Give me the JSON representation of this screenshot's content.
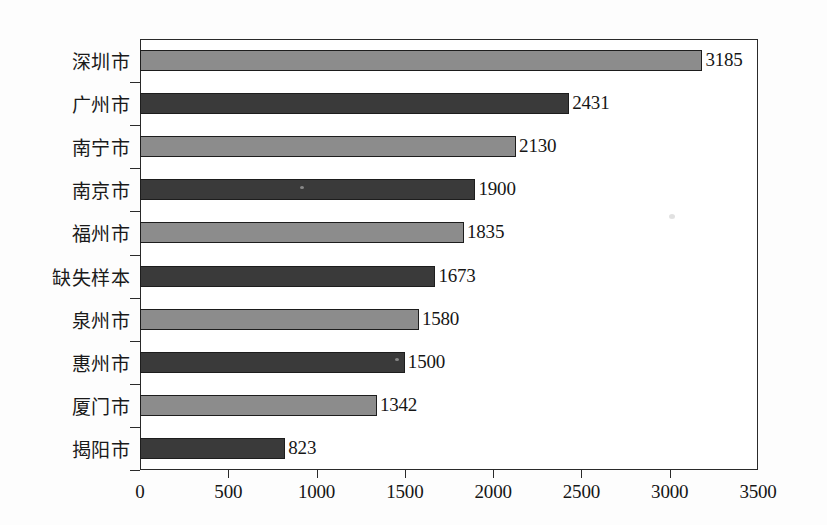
{
  "chart_data": {
    "type": "bar",
    "orientation": "horizontal",
    "title": "",
    "xlabel": "",
    "ylabel": "",
    "categories": [
      "深圳市",
      "广州市",
      "南宁市",
      "南京市",
      "福州市",
      "缺失样本",
      "泉州市",
      "惠州市",
      "厦门市",
      "揭阳市"
    ],
    "values": [
      3185,
      2431,
      2130,
      1900,
      1835,
      1673,
      1580,
      1500,
      1342,
      823
    ],
    "value_labels": [
      "3185",
      "2431",
      "2130",
      "1900",
      "1835",
      "1673",
      "1580",
      "1500",
      "1342",
      "823"
    ],
    "bar_colors": [
      "#8c8c8c",
      "#3a3a3a",
      "#8c8c8c",
      "#3a3a3a",
      "#8c8c8c",
      "#3a3a3a",
      "#8c8c8c",
      "#3a3a3a",
      "#8c8c8c",
      "#3a3a3a"
    ],
    "xlim": [
      0,
      3500
    ],
    "xticks": [
      0,
      500,
      1000,
      1500,
      2000,
      2500,
      3000,
      3500
    ],
    "xtick_labels": [
      "0",
      "500",
      "1000",
      "1500",
      "2000",
      "2500",
      "3000",
      "3500"
    ],
    "grid": false,
    "legend": null,
    "frame": true
  },
  "colors": {
    "bar_light": "#8c8c8c",
    "bar_dark": "#3a3a3a",
    "axis": "#2a2a2a",
    "text": "#161616",
    "background": "#fdfdfd"
  }
}
